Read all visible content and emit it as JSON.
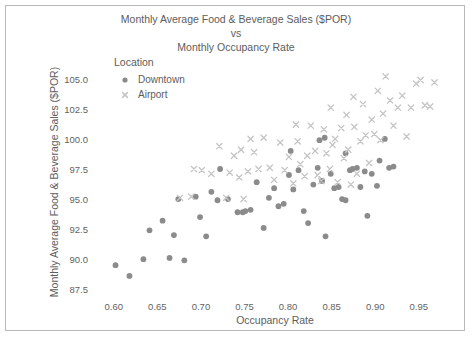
{
  "chart_data": {
    "type": "scatter",
    "title": "Monthly Average Food & Beverage Sales ($POR)\nvs\nMonthly Occupancy Rate",
    "title_line1": "Monthly Average Food & Beverage Sales ($POR)",
    "title_line2": "vs",
    "title_line3": "Monthly Occupancy Rate",
    "xlabel": "Occupancy Rate",
    "ylabel": "Monthly Average Food & Beverage Sales ($POR)",
    "xlim": [
      0.575,
      0.995
    ],
    "ylim": [
      86.6,
      106.4
    ],
    "xticks": [
      0.6,
      0.65,
      0.7,
      0.75,
      0.8,
      0.85,
      0.9,
      0.95
    ],
    "xticklabels": [
      "0.60",
      "0.65",
      "0.70",
      "0.75",
      "0.80",
      "0.85",
      "0.90",
      "0.95"
    ],
    "yticks": [
      87.5,
      90.0,
      92.5,
      95.0,
      97.5,
      100.0,
      102.5,
      105.0
    ],
    "yticklabels": [
      "87.5",
      "90.0",
      "92.5",
      "95.0",
      "97.5",
      "100.0",
      "102.5",
      "105.0"
    ],
    "grid": false,
    "legend_title": "Location",
    "legend_position": "upper-left-inside",
    "series": [
      {
        "name": "Downtown",
        "marker": "circle",
        "color": "#8b8b8b",
        "points": [
          [
            0.602,
            89.5
          ],
          [
            0.618,
            88.6
          ],
          [
            0.634,
            90.0
          ],
          [
            0.641,
            92.4
          ],
          [
            0.656,
            93.2
          ],
          [
            0.664,
            90.1
          ],
          [
            0.669,
            92.0
          ],
          [
            0.674,
            95.0
          ],
          [
            0.681,
            89.9
          ],
          [
            0.694,
            95.2
          ],
          [
            0.699,
            93.5
          ],
          [
            0.706,
            91.9
          ],
          [
            0.712,
            95.6
          ],
          [
            0.719,
            94.9
          ],
          [
            0.722,
            97.5
          ],
          [
            0.731,
            95.0
          ],
          [
            0.742,
            93.9
          ],
          [
            0.748,
            93.9
          ],
          [
            0.751,
            94.0
          ],
          [
            0.757,
            94.1
          ],
          [
            0.764,
            96.4
          ],
          [
            0.772,
            92.6
          ],
          [
            0.778,
            95.1
          ],
          [
            0.784,
            95.9
          ],
          [
            0.789,
            94.4
          ],
          [
            0.795,
            94.6
          ],
          [
            0.801,
            97.0
          ],
          [
            0.806,
            95.8
          ],
          [
            0.812,
            97.4
          ],
          [
            0.818,
            94.0
          ],
          [
            0.823,
            93.0
          ],
          [
            0.829,
            96.2
          ],
          [
            0.834,
            97.6
          ],
          [
            0.839,
            96.5
          ],
          [
            0.843,
            91.9
          ],
          [
            0.849,
            97.1
          ],
          [
            0.853,
            95.9
          ],
          [
            0.858,
            96.0
          ],
          [
            0.862,
            95.0
          ],
          [
            0.866,
            94.9
          ],
          [
            0.871,
            97.4
          ],
          [
            0.874,
            97.5
          ],
          [
            0.879,
            97.6
          ],
          [
            0.883,
            96.0
          ],
          [
            0.888,
            97.3
          ],
          [
            0.891,
            93.6
          ],
          [
            0.896,
            97.1
          ],
          [
            0.902,
            96.1
          ],
          [
            0.905,
            98.2
          ],
          [
            0.911,
            100.0
          ],
          [
            0.916,
            97.6
          ],
          [
            0.921,
            97.7
          ],
          [
            0.842,
            100.1
          ],
          [
            0.836,
            99.9
          ],
          [
            0.866,
            98.8
          ],
          [
            0.803,
            99.0
          ]
        ]
      },
      {
        "name": "Airport",
        "marker": "x",
        "color": "#c4c4c4",
        "points": [
          [
            0.676,
            95.1
          ],
          [
            0.689,
            95.2
          ],
          [
            0.692,
            97.5
          ],
          [
            0.701,
            97.4
          ],
          [
            0.712,
            97.1
          ],
          [
            0.721,
            99.4
          ],
          [
            0.729,
            95.1
          ],
          [
            0.733,
            97.2
          ],
          [
            0.738,
            98.6
          ],
          [
            0.744,
            96.8
          ],
          [
            0.749,
            95.0
          ],
          [
            0.754,
            97.3
          ],
          [
            0.761,
            98.9
          ],
          [
            0.766,
            97.5
          ],
          [
            0.772,
            100.1
          ],
          [
            0.779,
            97.6
          ],
          [
            0.784,
            96.6
          ],
          [
            0.791,
            99.7
          ],
          [
            0.796,
            97.4
          ],
          [
            0.801,
            98.5
          ],
          [
            0.806,
            96.3
          ],
          [
            0.811,
            99.8
          ],
          [
            0.814,
            97.9
          ],
          [
            0.819,
            96.9
          ],
          [
            0.822,
            98.6
          ],
          [
            0.826,
            101.1
          ],
          [
            0.831,
            99.0
          ],
          [
            0.834,
            97.0
          ],
          [
            0.838,
            96.5
          ],
          [
            0.841,
            100.8
          ],
          [
            0.844,
            98.8
          ],
          [
            0.848,
            97.5
          ],
          [
            0.851,
            99.5
          ],
          [
            0.854,
            100.0
          ],
          [
            0.857,
            96.4
          ],
          [
            0.861,
            100.9
          ],
          [
            0.864,
            98.4
          ],
          [
            0.867,
            102.0
          ],
          [
            0.869,
            99.1
          ],
          [
            0.872,
            96.2
          ],
          [
            0.876,
            101.0
          ],
          [
            0.879,
            97.1
          ],
          [
            0.883,
            99.8
          ],
          [
            0.886,
            102.9
          ],
          [
            0.889,
            100.3
          ],
          [
            0.893,
            98.0
          ],
          [
            0.896,
            101.6
          ],
          [
            0.899,
            100.4
          ],
          [
            0.903,
            104.0
          ],
          [
            0.906,
            99.9
          ],
          [
            0.909,
            102.1
          ],
          [
            0.912,
            105.2
          ],
          [
            0.917,
            103.2
          ],
          [
            0.921,
            101.1
          ],
          [
            0.926,
            102.6
          ],
          [
            0.931,
            103.6
          ],
          [
            0.936,
            100.2
          ],
          [
            0.941,
            102.6
          ],
          [
            0.947,
            104.6
          ],
          [
            0.952,
            104.9
          ],
          [
            0.957,
            102.8
          ],
          [
            0.963,
            102.7
          ],
          [
            0.968,
            104.7
          ],
          [
            0.875,
            103.5
          ],
          [
            0.849,
            102.6
          ],
          [
            0.809,
            101.2
          ],
          [
            0.757,
            100.0
          ],
          [
            0.746,
            99.1
          ]
        ]
      }
    ]
  },
  "legend": {
    "title": "Location",
    "entries": [
      {
        "label": "Downtown",
        "marker": "circle",
        "color": "#8b8b8b"
      },
      {
        "label": "Airport",
        "marker": "x",
        "color": "#c4c4c4"
      }
    ]
  },
  "colors": {
    "downtown": "#8b8b8b",
    "airport": "#c4c4c4",
    "text": "#5d5d5d",
    "frame": "#b9b9b9"
  }
}
